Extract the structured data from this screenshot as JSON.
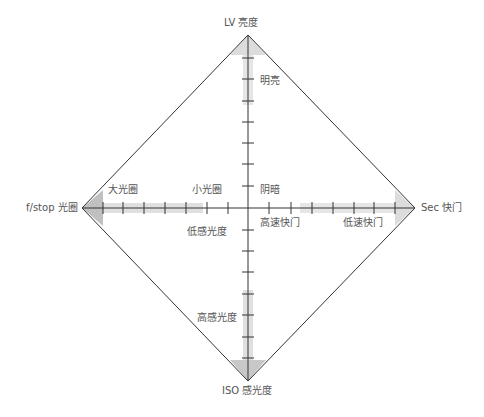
{
  "diagram": {
    "axes": {
      "top": "LV 亮度",
      "bottom": "ISO 感光度",
      "left": "f/stop 光圈",
      "right": "Sec 快门"
    },
    "annotations": {
      "bright": "明亮",
      "dark": "阴暗",
      "large_aperture": "大光圈",
      "small_aperture": "小光圈",
      "high_speed_shutter": "高速快门",
      "low_speed_shutter": "低速快门",
      "low_iso": "低感光度",
      "high_iso": "高感光度"
    },
    "colors": {
      "line": "#333333",
      "shade": "#cccccc",
      "text": "#555555"
    }
  }
}
